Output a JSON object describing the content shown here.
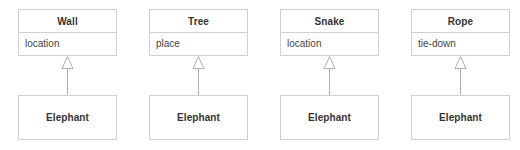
{
  "diagram": {
    "type": "uml-class-diagram",
    "relationship": "generalization",
    "colors": {
      "box_border": "#d0d0d0",
      "box_fill": "#ffffff",
      "connector_line": "#b0b0b0",
      "arrowhead_fill": "#ffffff",
      "arrowhead_stroke": "#b0b0b0",
      "title_text": "#333333",
      "attribute_text": "#444444",
      "background": "#ffffff"
    },
    "groups": [
      {
        "parent": {
          "name": "Wall",
          "attribute": "location"
        },
        "child": {
          "name": "Elephant"
        },
        "arrow": "hollow-triangle-up"
      },
      {
        "parent": {
          "name": "Tree",
          "attribute": "place"
        },
        "child": {
          "name": "Elephant"
        },
        "arrow": "hollow-triangle-up"
      },
      {
        "parent": {
          "name": "Snake",
          "attribute": "location"
        },
        "child": {
          "name": "Elephant"
        },
        "arrow": "hollow-triangle-up"
      },
      {
        "parent": {
          "name": "Rope",
          "attribute": "tie-down"
        },
        "child": {
          "name": "Elephant"
        },
        "arrow": "hollow-triangle-up"
      }
    ]
  }
}
